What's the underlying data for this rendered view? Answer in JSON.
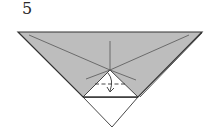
{
  "diagram": {
    "type": "origami-step",
    "step_number": "5",
    "colors": {
      "paper_colored": "#bdbdbd",
      "paper_white": "#ffffff",
      "lines": "#333333",
      "crease": "#555555"
    },
    "elements": [
      {
        "name": "colored-flap",
        "description": "Gray inverted triangle folded layer"
      },
      {
        "name": "white-inner-triangle",
        "description": "Exposed white triangle at center"
      },
      {
        "name": "white-bottom-point",
        "description": "White bottom triangle point"
      },
      {
        "name": "valley-fold-line",
        "description": "Dashed horizontal fold line"
      },
      {
        "name": "fold-arrow",
        "description": "Arrow showing tip folded down"
      },
      {
        "name": "crease-lines",
        "description": "Diagonal and vertical crease lines radiating from center"
      }
    ]
  }
}
